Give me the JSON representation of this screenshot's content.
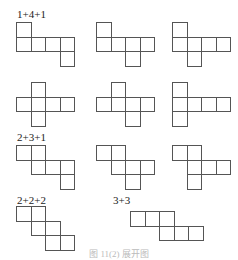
{
  "diagram": {
    "cell_size": 14.5,
    "groups": [
      {
        "label": "1+4+1",
        "label_pos": [
          17,
          9
        ]
      },
      {
        "label": "2+3+1",
        "label_pos": [
          17,
          132
        ]
      },
      {
        "label": "2+2+2",
        "label_pos": [
          17,
          195
        ]
      },
      {
        "label": "3+3",
        "label_pos": [
          113,
          195
        ]
      }
    ],
    "nets": [
      {
        "group": "1+4+1",
        "origin": [
          16,
          22
        ],
        "cells": [
          [
            0,
            0
          ],
          [
            0,
            1
          ],
          [
            1,
            1
          ],
          [
            2,
            1
          ],
          [
            3,
            1
          ],
          [
            3,
            2
          ]
        ]
      },
      {
        "group": "1+4+1",
        "origin": [
          96,
          22
        ],
        "cells": [
          [
            0,
            0
          ],
          [
            0,
            1
          ],
          [
            1,
            1
          ],
          [
            2,
            1
          ],
          [
            3,
            1
          ],
          [
            2,
            2
          ]
        ]
      },
      {
        "group": "1+4+1",
        "origin": [
          172,
          22
        ],
        "cells": [
          [
            0,
            0
          ],
          [
            0,
            1
          ],
          [
            1,
            1
          ],
          [
            2,
            1
          ],
          [
            3,
            1
          ],
          [
            1,
            2
          ]
        ]
      },
      {
        "group": "1+4+1",
        "origin": [
          16,
          82
        ],
        "cells": [
          [
            1,
            0
          ],
          [
            0,
            1
          ],
          [
            1,
            1
          ],
          [
            2,
            1
          ],
          [
            3,
            1
          ],
          [
            1,
            2
          ]
        ]
      },
      {
        "group": "1+4+1",
        "origin": [
          96,
          82
        ],
        "cells": [
          [
            1,
            0
          ],
          [
            0,
            1
          ],
          [
            1,
            1
          ],
          [
            2,
            1
          ],
          [
            3,
            1
          ],
          [
            2,
            2
          ]
        ]
      },
      {
        "group": "1+4+1",
        "origin": [
          172,
          82
        ],
        "cells": [
          [
            0,
            0
          ],
          [
            0,
            1
          ],
          [
            1,
            1
          ],
          [
            2,
            1
          ],
          [
            3,
            1
          ],
          [
            0,
            2
          ]
        ]
      },
      {
        "group": "2+3+1",
        "origin": [
          16,
          145
        ],
        "cells": [
          [
            0,
            0
          ],
          [
            1,
            0
          ],
          [
            1,
            1
          ],
          [
            2,
            1
          ],
          [
            3,
            1
          ],
          [
            3,
            2
          ]
        ]
      },
      {
        "group": "2+3+1",
        "origin": [
          96,
          145
        ],
        "cells": [
          [
            0,
            0
          ],
          [
            1,
            0
          ],
          [
            1,
            1
          ],
          [
            2,
            1
          ],
          [
            3,
            1
          ],
          [
            2,
            2
          ]
        ]
      },
      {
        "group": "2+3+1",
        "origin": [
          172,
          145
        ],
        "cells": [
          [
            0,
            0
          ],
          [
            1,
            0
          ],
          [
            1,
            1
          ],
          [
            2,
            1
          ],
          [
            3,
            1
          ],
          [
            1,
            2
          ]
        ]
      },
      {
        "group": "2+2+2",
        "origin": [
          16,
          206
        ],
        "cells": [
          [
            0,
            0
          ],
          [
            1,
            0
          ],
          [
            1,
            1
          ],
          [
            2,
            1
          ],
          [
            2,
            2
          ],
          [
            3,
            2
          ]
        ]
      },
      {
        "group": "3+3",
        "origin": [
          130,
          211
        ],
        "cells": [
          [
            0,
            0
          ],
          [
            1,
            0
          ],
          [
            2,
            0
          ],
          [
            2,
            1
          ],
          [
            3,
            1
          ],
          [
            4,
            1
          ]
        ]
      }
    ],
    "caption": "图 11(2) 展开图"
  }
}
